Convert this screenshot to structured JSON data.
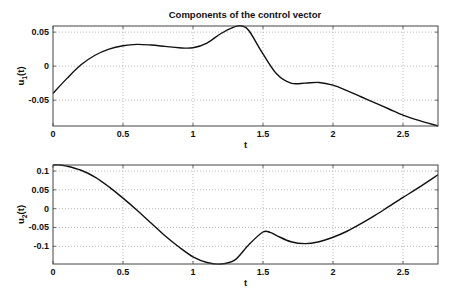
{
  "chart_data": [
    {
      "type": "line",
      "title": "Components of the control vector",
      "xlabel": "t",
      "ylabel": "u_1(t)",
      "xlim": [
        0,
        2.75
      ],
      "ylim": [
        -0.088,
        0.059
      ],
      "grid": true,
      "xticks": [
        0,
        0.5,
        1,
        1.5,
        2,
        2.5
      ],
      "xtick_labels": [
        "0",
        "0.5",
        "1",
        "1.5",
        "2",
        "2.5"
      ],
      "yticks": [
        0.05,
        0,
        -0.05
      ],
      "ytick_labels": [
        "0.05",
        "0",
        "-0.05"
      ],
      "series": [
        {
          "name": "u1",
          "x": [
            0,
            0.1,
            0.2,
            0.3,
            0.4,
            0.5,
            0.6,
            0.7,
            0.8,
            0.9,
            1.0,
            1.1,
            1.2,
            1.3,
            1.35,
            1.4,
            1.5,
            1.6,
            1.7,
            1.8,
            1.9,
            2.0,
            2.1,
            2.2,
            2.3,
            2.4,
            2.5,
            2.6,
            2.75
          ],
          "values": [
            -0.04,
            -0.018,
            0.002,
            0.016,
            0.025,
            0.03,
            0.032,
            0.031,
            0.029,
            0.027,
            0.027,
            0.034,
            0.048,
            0.058,
            0.059,
            0.052,
            0.018,
            -0.012,
            -0.025,
            -0.025,
            -0.024,
            -0.028,
            -0.036,
            -0.045,
            -0.054,
            -0.063,
            -0.072,
            -0.079,
            -0.088
          ]
        }
      ]
    },
    {
      "type": "line",
      "title": "",
      "xlabel": "t",
      "ylabel": "u_2(t)",
      "xlim": [
        0,
        2.75
      ],
      "ylim": [
        -0.147,
        0.116
      ],
      "grid": true,
      "xticks": [
        0,
        0.5,
        1,
        1.5,
        2,
        2.5
      ],
      "xtick_labels": [
        "0",
        "0.5",
        "1",
        "1.5",
        "2",
        "2.5"
      ],
      "yticks": [
        0.1,
        0.05,
        0,
        -0.05,
        -0.1
      ],
      "ytick_labels": [
        "0.1",
        "0.05",
        "0",
        "-0.05",
        "-0.1"
      ],
      "series": [
        {
          "name": "u2",
          "x": [
            0,
            0.05,
            0.1,
            0.2,
            0.3,
            0.4,
            0.5,
            0.6,
            0.7,
            0.8,
            0.9,
            1.0,
            1.1,
            1.2,
            1.3,
            1.4,
            1.5,
            1.55,
            1.6,
            1.7,
            1.8,
            1.9,
            2.0,
            2.1,
            2.2,
            2.3,
            2.4,
            2.5,
            2.6,
            2.75
          ],
          "values": [
            0.116,
            0.116,
            0.113,
            0.102,
            0.084,
            0.058,
            0.028,
            -0.004,
            -0.038,
            -0.072,
            -0.102,
            -0.128,
            -0.143,
            -0.147,
            -0.136,
            -0.095,
            -0.062,
            -0.063,
            -0.072,
            -0.088,
            -0.093,
            -0.088,
            -0.076,
            -0.06,
            -0.04,
            -0.018,
            0.006,
            0.03,
            0.053,
            0.09
          ]
        }
      ]
    }
  ],
  "axes_layout": [
    {
      "left": 53,
      "top": 26,
      "right": 438,
      "bottom": 126
    },
    {
      "left": 53,
      "top": 165,
      "right": 438,
      "bottom": 264
    }
  ]
}
